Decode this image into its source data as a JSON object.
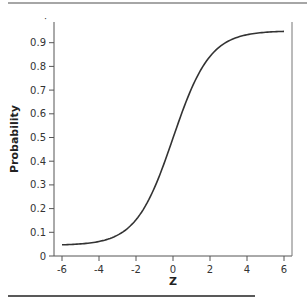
{
  "chart_data": {
    "type": "line",
    "title": "",
    "xlabel": "Z",
    "ylabel": "Probability",
    "xlim": [
      -6,
      6
    ],
    "ylim": [
      0,
      0.95
    ],
    "x_ticks": [
      -6,
      -4,
      -2,
      0,
      2,
      4,
      6
    ],
    "x_tick_labels": [
      "-6",
      "-4",
      "-2",
      "0",
      "2",
      "4",
      "6"
    ],
    "y_ticks": [
      0,
      0.1,
      0.2,
      0.3,
      0.4,
      0.5,
      0.6,
      0.7,
      0.8,
      0.9
    ],
    "y_tick_labels": [
      "0",
      "0.1",
      "0.2",
      "0.3",
      "0.4",
      "0.5",
      "0.6",
      "0.7",
      "0.8",
      "0.9"
    ],
    "grid": false,
    "legend": null,
    "series": [
      {
        "name": "logistic",
        "x": [
          -6,
          -5,
          -4,
          -3,
          -2,
          -1.5,
          -1,
          -0.5,
          0,
          0.5,
          1,
          1.5,
          2,
          3,
          4,
          5,
          6
        ],
        "values": [
          0.052,
          0.056,
          0.066,
          0.093,
          0.157,
          0.212,
          0.292,
          0.392,
          0.5,
          0.608,
          0.708,
          0.788,
          0.843,
          0.907,
          0.934,
          0.944,
          0.948
        ]
      }
    ],
    "line_color": "#333333"
  }
}
